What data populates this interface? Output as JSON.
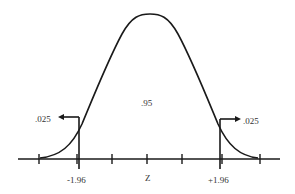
{
  "diagram": {
    "type": "normal-distribution-two-tailed",
    "center_label": ".95",
    "axis_label": "Z",
    "left_critical_value": "-1.96",
    "right_critical_value": "+1.96",
    "left_tail_label": ".025",
    "right_tail_label": ".025",
    "line_color": "#1a1a1a",
    "text_color": "#333333",
    "background": "#ffffff"
  }
}
